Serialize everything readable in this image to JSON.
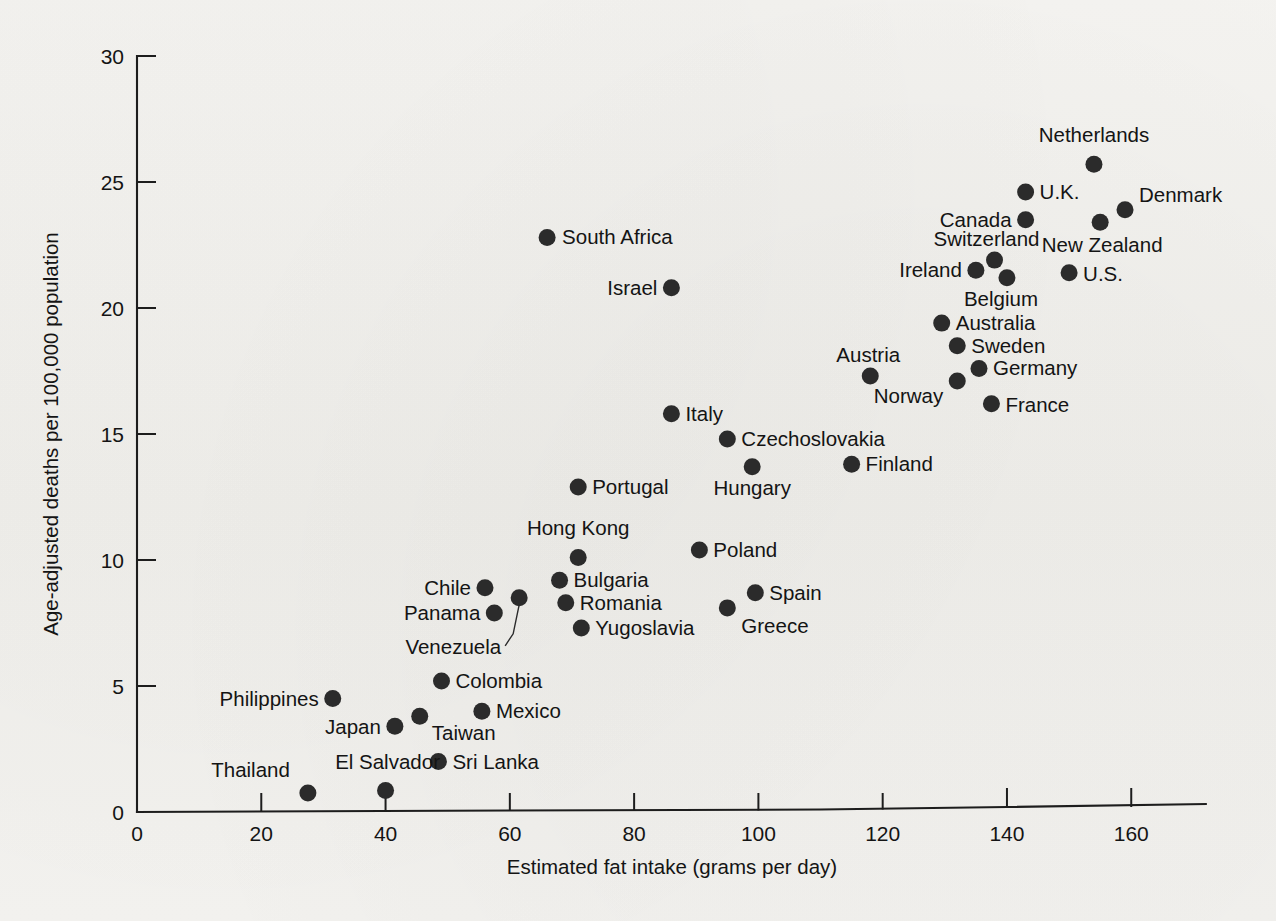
{
  "figure": {
    "background_color": "#f2f1ee",
    "ink_color": "#1d1d1d",
    "marker_color": "#2b2b2b"
  },
  "chart_data": {
    "type": "scatter",
    "title": "",
    "xlabel": "Estimated fat intake (grams per day)",
    "ylabel": "Age-adjusted deaths per 100,000 population",
    "xlim": [
      0,
      172
    ],
    "ylim": [
      0,
      30
    ],
    "xticks": [
      0,
      20,
      40,
      60,
      80,
      100,
      120,
      140,
      160
    ],
    "yticks": [
      0,
      5,
      10,
      15,
      20,
      25,
      30
    ],
    "xtick_labels": [
      "0",
      "20",
      "40",
      "60",
      "80",
      "100",
      "120",
      "140",
      "160"
    ],
    "ytick_labels": [
      "0",
      "5",
      "10",
      "15",
      "20",
      "25",
      "30"
    ],
    "grid": false,
    "legend": null,
    "points": [
      {
        "label": "Netherlands",
        "x": 154.0,
        "y": 25.7,
        "lx": 0,
        "ly": -22,
        "anchor": "middle"
      },
      {
        "label": "U.K.",
        "x": 143.0,
        "y": 24.6,
        "lx": 14,
        "ly": 7,
        "anchor": "start"
      },
      {
        "label": "Denmark",
        "x": 159.0,
        "y": 23.9,
        "lx": 14,
        "ly": -8,
        "anchor": "start"
      },
      {
        "label": "Canada",
        "x": 143.0,
        "y": 23.5,
        "lx": -14,
        "ly": 7,
        "anchor": "end"
      },
      {
        "label": "New Zealand",
        "x": 155.0,
        "y": 23.4,
        "lx": 2,
        "ly": 30,
        "anchor": "middle"
      },
      {
        "label": "South Africa",
        "x": 66.0,
        "y": 22.8,
        "lx": 15,
        "ly": 7,
        "anchor": "start"
      },
      {
        "label": "Switzerland",
        "x": 138.0,
        "y": 21.9,
        "lx": -8,
        "ly": -14,
        "anchor": "middle"
      },
      {
        "label": "Ireland",
        "x": 135.0,
        "y": 21.5,
        "lx": -14,
        "ly": 7,
        "anchor": "end"
      },
      {
        "label": "U.S.",
        "x": 150.0,
        "y": 21.4,
        "lx": 14,
        "ly": 8,
        "anchor": "start"
      },
      {
        "label": "Belgium",
        "x": 140.0,
        "y": 21.2,
        "lx": -6,
        "ly": 28,
        "anchor": "middle"
      },
      {
        "label": "Israel",
        "x": 86.0,
        "y": 20.8,
        "lx": -14,
        "ly": 7,
        "anchor": "end"
      },
      {
        "label": "Australia",
        "x": 129.5,
        "y": 19.4,
        "lx": 14,
        "ly": 7,
        "anchor": "start"
      },
      {
        "label": "Sweden",
        "x": 132.0,
        "y": 18.5,
        "lx": 14,
        "ly": 7,
        "anchor": "start"
      },
      {
        "label": "Germany",
        "x": 135.5,
        "y": 17.6,
        "lx": 14,
        "ly": 7,
        "anchor": "start"
      },
      {
        "label": "Austria",
        "x": 118.0,
        "y": 17.3,
        "lx": -2,
        "ly": -14,
        "anchor": "middle"
      },
      {
        "label": "Norway",
        "x": 132.0,
        "y": 17.1,
        "lx": -14,
        "ly": 22,
        "anchor": "end"
      },
      {
        "label": "France",
        "x": 137.5,
        "y": 16.2,
        "lx": 14,
        "ly": 8,
        "anchor": "start"
      },
      {
        "label": "Italy",
        "x": 86.0,
        "y": 15.8,
        "lx": 14,
        "ly": 7,
        "anchor": "start"
      },
      {
        "label": "Czechoslovakia",
        "x": 95.0,
        "y": 14.8,
        "lx": 14,
        "ly": 7,
        "anchor": "start"
      },
      {
        "label": "Finland",
        "x": 115.0,
        "y": 13.8,
        "lx": 14,
        "ly": 7,
        "anchor": "start"
      },
      {
        "label": "Hungary",
        "x": 99.0,
        "y": 13.7,
        "lx": 0,
        "ly": 28,
        "anchor": "middle"
      },
      {
        "label": "Portugal",
        "x": 71.0,
        "y": 12.9,
        "lx": 14,
        "ly": 7,
        "anchor": "start"
      },
      {
        "label": "Poland",
        "x": 90.5,
        "y": 10.4,
        "lx": 14,
        "ly": 7,
        "anchor": "start"
      },
      {
        "label": "Hong Kong",
        "x": 71.0,
        "y": 10.1,
        "lx": 0,
        "ly": -22,
        "anchor": "middle"
      },
      {
        "label": "Bulgaria",
        "x": 68.0,
        "y": 9.2,
        "lx": 14,
        "ly": 7,
        "anchor": "start"
      },
      {
        "label": "Chile",
        "x": 56.0,
        "y": 8.9,
        "lx": -14,
        "ly": 7,
        "anchor": "end"
      },
      {
        "label": "Spain",
        "x": 99.5,
        "y": 8.7,
        "lx": 14,
        "ly": 7,
        "anchor": "start"
      },
      {
        "label": "Venezuela",
        "x": 61.5,
        "y": 8.5,
        "lx": -18,
        "ly": 56,
        "anchor": "end",
        "leader": true
      },
      {
        "label": "Romania",
        "x": 69.0,
        "y": 8.3,
        "lx": 14,
        "ly": 7,
        "anchor": "start"
      },
      {
        "label": "Greece",
        "x": 95.0,
        "y": 8.1,
        "lx": 14,
        "ly": 25,
        "anchor": "start"
      },
      {
        "label": "Panama",
        "x": 57.5,
        "y": 7.9,
        "lx": -14,
        "ly": 7,
        "anchor": "end"
      },
      {
        "label": "Yugoslavia",
        "x": 71.5,
        "y": 7.3,
        "lx": 14,
        "ly": 7,
        "anchor": "start"
      },
      {
        "label": "Colombia",
        "x": 49.0,
        "y": 5.2,
        "lx": 14,
        "ly": 7,
        "anchor": "start"
      },
      {
        "label": "Philippines",
        "x": 31.5,
        "y": 4.5,
        "lx": -14,
        "ly": 7,
        "anchor": "end"
      },
      {
        "label": "Mexico",
        "x": 55.5,
        "y": 4.0,
        "lx": 14,
        "ly": 7,
        "anchor": "start"
      },
      {
        "label": "Taiwan",
        "x": 45.5,
        "y": 3.8,
        "lx": 12,
        "ly": 24,
        "anchor": "start"
      },
      {
        "label": "Japan",
        "x": 41.5,
        "y": 3.4,
        "lx": -14,
        "ly": 8,
        "anchor": "end"
      },
      {
        "label": "Sri Lanka",
        "x": 48.5,
        "y": 2.0,
        "lx": 14,
        "ly": 7,
        "anchor": "start"
      },
      {
        "label": "El Salvador",
        "x": 40.0,
        "y": 0.85,
        "lx": 2,
        "ly": -22,
        "anchor": "middle"
      },
      {
        "label": "Thailand",
        "x": 27.5,
        "y": 0.75,
        "lx": -18,
        "ly": -16,
        "anchor": "end"
      }
    ]
  }
}
